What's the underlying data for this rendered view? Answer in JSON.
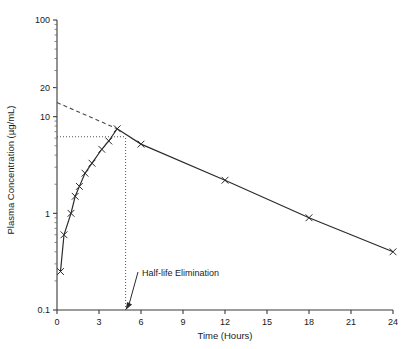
{
  "chart_data": {
    "type": "line",
    "title": "",
    "xlabel": "Time (Hours)",
    "ylabel": "Plasma Concentration (µg/mL)",
    "yscale": "log",
    "xlim": [
      0,
      24
    ],
    "ylim": [
      0.1,
      100
    ],
    "xticks": [
      0,
      3,
      6,
      9,
      12,
      15,
      18,
      21,
      24
    ],
    "xtick_labels": [
      "0",
      "3",
      "6",
      "9",
      "12",
      "15",
      "18",
      "21",
      "24"
    ],
    "yticks": [
      0.1,
      1,
      10,
      20,
      100
    ],
    "ytick_labels": [
      "0.1",
      "1",
      "10",
      "20",
      "100"
    ],
    "grid": false,
    "legend": null,
    "series": [
      {
        "name": "Plasma concentration",
        "marker": "x",
        "linestyle": "solid",
        "x": [
          0.25,
          0.5,
          1.0,
          1.3,
          1.6,
          2.0,
          2.5,
          3.2,
          3.7,
          4.3,
          6.0,
          12.0,
          18.0,
          24.0
        ],
        "y": [
          0.25,
          0.6,
          1.0,
          1.5,
          1.9,
          2.6,
          3.3,
          4.6,
          5.6,
          7.5,
          5.2,
          2.2,
          0.9,
          0.4
        ]
      },
      {
        "name": "Extrapolated terminal elimination line",
        "marker": "none",
        "linestyle": "dashed",
        "x": [
          0.0,
          4.3
        ],
        "y": [
          14.0,
          7.5
        ]
      }
    ],
    "reference_lines": [
      {
        "name": "cmax-horizontal-dotted",
        "orientation": "horizontal",
        "value": 6.2,
        "from_x": 0.0,
        "to_x": 4.9,
        "linestyle": "dotted"
      },
      {
        "name": "half-life-vertical-dotted",
        "orientation": "vertical",
        "value": 4.9,
        "from_y": 0.1,
        "to_y": 6.2,
        "linestyle": "dotted"
      }
    ],
    "annotations": [
      {
        "name": "half-life-elimination",
        "text": "Half-life Elimination",
        "target_x": 4.9,
        "target_y": 0.1
      }
    ]
  },
  "axes": {
    "x_axis_label": "Time (Hours)",
    "y_axis_label": "Plasma Concentration (µg/mL)",
    "x_tick_labels": [
      "0",
      "3",
      "6",
      "9",
      "12",
      "15",
      "18",
      "21",
      "24"
    ],
    "y_tick_labels": [
      "0.1",
      "1",
      "10",
      "20",
      "100"
    ]
  },
  "annotation": {
    "half_life_text": "Half-life Elimination"
  },
  "colors": {
    "axis": "#3a3a3a",
    "curve": "#2b2b2b",
    "marker": "#2b2b2b",
    "dashed": "#4a4a4a",
    "dotted": "#555555",
    "text": "#1a1a1a",
    "background": "#ffffff"
  }
}
